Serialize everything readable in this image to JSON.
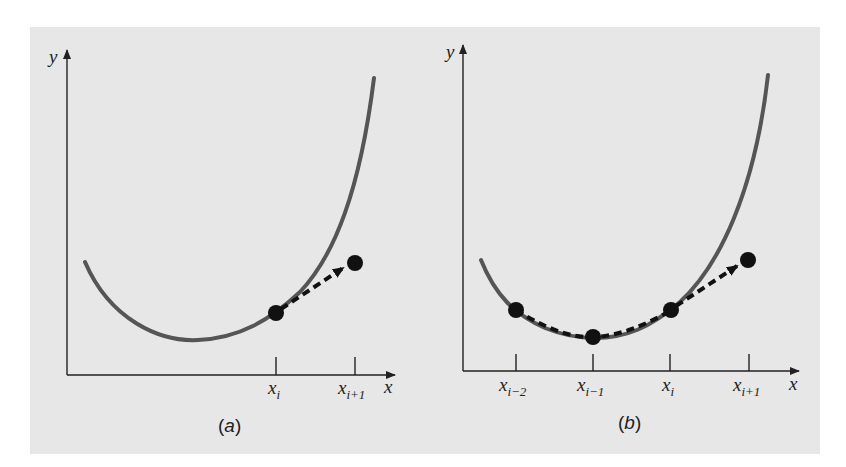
{
  "figure": {
    "background_color": "#e7e7e7",
    "curve_color": "#555555",
    "point_color": "#111111",
    "arrow_color": "#111111"
  },
  "panel_a": {
    "caption_open": "(",
    "caption_letter": "a",
    "caption_close": ")",
    "y_axis_label": "y",
    "x_axis_label": "x",
    "ticks": [
      {
        "base": "x",
        "subscript": "i"
      },
      {
        "base": "x",
        "subscript": "i+1"
      }
    ],
    "description": "Single-step (Euler-type) extrapolation: from point at x_i, a dashed arrow projects to the point at x_i+1"
  },
  "panel_b": {
    "caption_open": "(",
    "caption_letter": "b",
    "caption_close": ")",
    "y_axis_label": "y",
    "x_axis_label": "x",
    "ticks": [
      {
        "base": "x",
        "subscript": "i−2"
      },
      {
        "base": "x",
        "subscript": "i−1"
      },
      {
        "base": "x",
        "subscript": "i"
      },
      {
        "base": "x",
        "subscript": "i+1"
      }
    ],
    "description": "Multistep extrapolation: points at x_i-2, x_i-1, x_i are connected by a dashed curve that projects to the point at x_i+1"
  }
}
